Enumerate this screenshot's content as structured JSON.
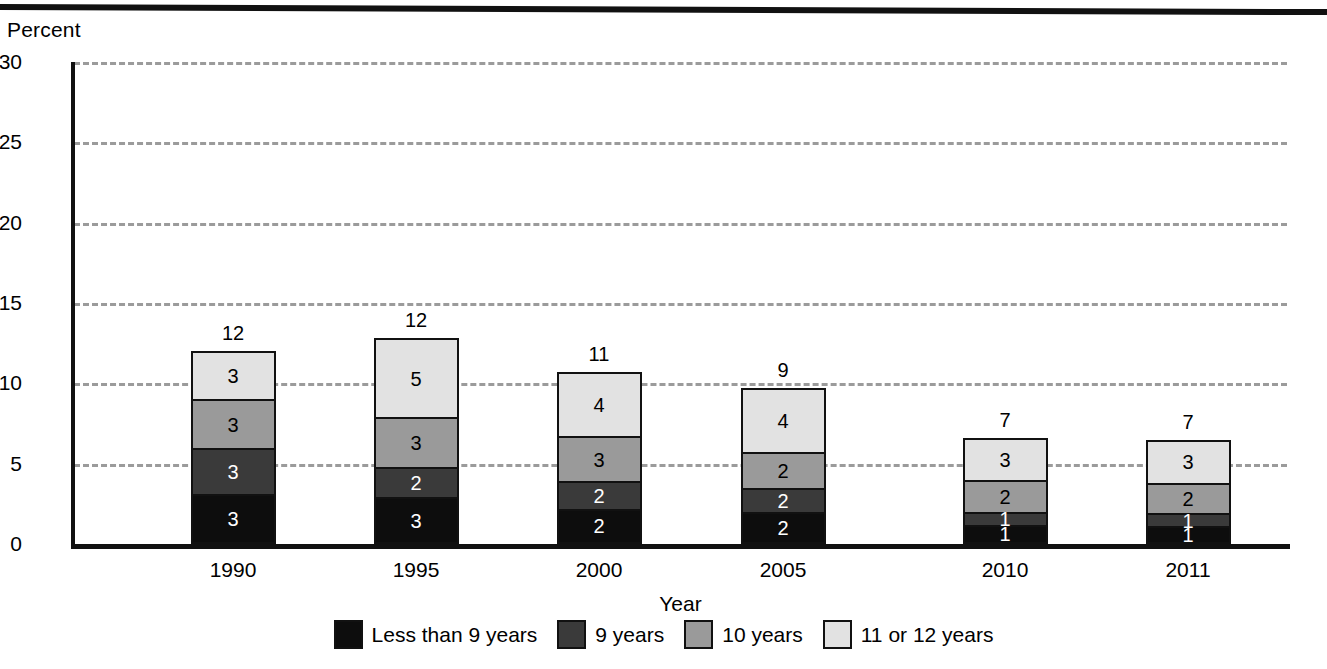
{
  "chart_data": {
    "type": "bar",
    "subtype": "stacked-bar",
    "title": "",
    "ylabel": "Percent",
    "xlabel": "Year",
    "ylim": [
      0,
      30
    ],
    "yticks": [
      0,
      5,
      10,
      15,
      20,
      25,
      30
    ],
    "grid": true,
    "grid_style": "dashed",
    "grid_color": "#9b9b9b",
    "legend_position": "bottom",
    "categories": [
      "1990",
      "1995",
      "2000",
      "2005",
      "2010",
      "2011"
    ],
    "series": [
      {
        "name": "Less than 9 years",
        "color": "#0d0d0d",
        "label_color": "#ffffff",
        "values": [
          3,
          3,
          2,
          2,
          1,
          1
        ],
        "exact_values": [
          3.1,
          2.9,
          2.2,
          2.0,
          1.2,
          1.1
        ]
      },
      {
        "name": "9 years",
        "color": "#3a3a3a",
        "label_color": "#ffffff",
        "values": [
          3,
          2,
          2,
          2,
          1,
          1
        ],
        "exact_values": [
          2.9,
          1.9,
          1.7,
          1.5,
          0.8,
          0.8
        ]
      },
      {
        "name": "10 years",
        "color": "#9a9a9a",
        "label_color": "#000000",
        "values": [
          3,
          3,
          3,
          2,
          2,
          2
        ],
        "exact_values": [
          3.0,
          3.1,
          2.8,
          2.2,
          2.0,
          1.9
        ]
      },
      {
        "name": "11 or 12 years",
        "color": "#e2e2e2",
        "label_color": "#000000",
        "values": [
          3,
          5,
          4,
          4,
          3,
          3
        ],
        "exact_values": [
          3.0,
          4.9,
          4.0,
          4.0,
          2.6,
          2.7
        ]
      }
    ],
    "bar_totals": [
      12,
      12,
      11,
      9,
      7,
      7
    ],
    "bar_total_exact": [
      12.0,
      12.8,
      10.7,
      9.7,
      6.6,
      6.5
    ]
  },
  "axes": {
    "y_title": "Percent",
    "x_title": "Year",
    "y_tick_labels": [
      "30",
      "25",
      "20",
      "15",
      "10",
      "5",
      "0"
    ],
    "x_tick_labels": [
      "1990",
      "1995",
      "2000",
      "2005",
      "2010",
      "2011"
    ]
  },
  "legend": {
    "items": [
      {
        "label": "Less than 9 years",
        "color": "#0d0d0d"
      },
      {
        "label": "9 years",
        "color": "#3a3a3a"
      },
      {
        "label": "10 years",
        "color": "#9a9a9a"
      },
      {
        "label": "11 or 12 years",
        "color": "#e2e2e2"
      }
    ]
  }
}
